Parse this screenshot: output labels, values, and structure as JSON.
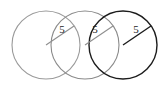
{
  "figure": {
    "background_color": "#ffffff",
    "canvas": {
      "width": 167,
      "height": 90
    },
    "circle_count": 3,
    "radius_value": "5"
  },
  "chart_data": {
    "type": "diagram",
    "title": "",
    "subtitle": "",
    "xlabel": "",
    "ylabel": "",
    "grid": false,
    "legend": "none",
    "shapes": [
      {
        "name": "circle-left",
        "kind": "circle",
        "cx": 46,
        "cy": 45,
        "r": 34,
        "stroke": "#9a9a9a",
        "stroke_width": 1.1,
        "fill": "none"
      },
      {
        "name": "circle-middle",
        "kind": "circle",
        "cx": 85,
        "cy": 45,
        "r": 34,
        "stroke": "#8a8a8a",
        "stroke_width": 1.1,
        "fill": "none"
      },
      {
        "name": "circle-right",
        "kind": "circle",
        "cx": 123,
        "cy": 45,
        "r": 34,
        "stroke": "#1c1c1c",
        "stroke_width": 1.4,
        "fill": "none"
      }
    ],
    "radii": [
      {
        "name": "radius-left",
        "from_x": 46,
        "from_y": 45,
        "to_x": 74,
        "to_y": 26,
        "stroke": "#8f8f8f",
        "stroke_width": 1.1,
        "label": "5",
        "label_x": 62,
        "label_y": 30
      },
      {
        "name": "radius-middle",
        "from_x": 85,
        "from_y": 45,
        "to_x": 113,
        "to_y": 26,
        "stroke": "#8f8f8f",
        "stroke_width": 1.1,
        "label": "5",
        "label_x": 95,
        "label_y": 30
      },
      {
        "name": "radius-right",
        "from_x": 123,
        "from_y": 45,
        "to_x": 151,
        "to_y": 26,
        "stroke": "#1c1c1c",
        "stroke_width": 1.4,
        "label": "5",
        "label_x": 136,
        "label_y": 30
      }
    ],
    "labels": [
      "5",
      "5",
      "5"
    ]
  }
}
